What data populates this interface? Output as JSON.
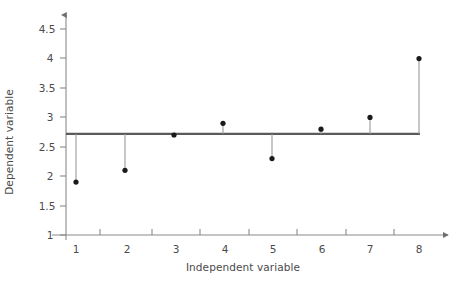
{
  "chart_data": {
    "type": "scatter",
    "title": "",
    "subtitle": "",
    "xlabel": "Independent variable",
    "ylabel": "Dependent variable",
    "x": [
      1,
      2,
      3,
      4,
      5,
      6,
      7,
      8
    ],
    "values": [
      1.9,
      2.1,
      2.7,
      2.9,
      2.3,
      2.8,
      3.0,
      4.0
    ],
    "series": [
      {
        "name": "Observations",
        "values": [
          1.9,
          2.1,
          2.7,
          2.9,
          2.3,
          2.8,
          3.0,
          4.0
        ]
      },
      {
        "name": "Reference line (mean)",
        "values": [
          2.72,
          2.72,
          2.72,
          2.72,
          2.72,
          2.72,
          2.72,
          2.72
        ]
      }
    ],
    "reference_line": 2.72,
    "xlim": [
      0.5,
      8.5
    ],
    "ylim": [
      1,
      4.75
    ],
    "xticks": [
      1,
      2,
      3,
      4,
      5,
      6,
      7,
      8
    ],
    "yticks": [
      1,
      1.5,
      2,
      2.5,
      3,
      3.5,
      4,
      4.5
    ],
    "xticklabels": [
      "1",
      "2",
      "3",
      "4",
      "5",
      "6",
      "7",
      "8"
    ],
    "yticklabels": [
      "1",
      "1.5",
      "2",
      "2.5",
      "3",
      "3.5",
      "4",
      "4.5"
    ],
    "grid": false,
    "legend": null,
    "annotations": [],
    "marker_style": "filled-circle",
    "stem_plot": true,
    "colors": {
      "marker": "#1a1a1a",
      "stem": "#9a9a9a",
      "reference_line": "#5a5a5a",
      "axis": "#7d7d7f",
      "text": "#4a4a4c",
      "background": "#ffffff"
    }
  }
}
